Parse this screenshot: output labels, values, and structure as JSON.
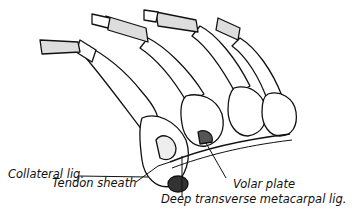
{
  "figure": {
    "type": "anatomical illustration",
    "ink_color": "#111111",
    "background_color": "#ffffff"
  },
  "labels": {
    "collateral": "Collateral lig.",
    "tendon_sheath": "Tendon sheath",
    "volar_plate": "Volar plate",
    "deep_transverse": "Deep transverse metacarpal lig."
  }
}
